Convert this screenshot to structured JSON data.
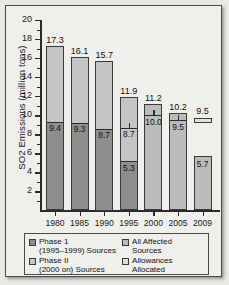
{
  "chart_data": {
    "type": "bar",
    "title": "",
    "xlabel": "",
    "ylabel": "SO2 Emissions (million tons)",
    "ylim": [
      0,
      20
    ],
    "ytick_step": 2,
    "grid": false,
    "legend_position": "below-axis",
    "categories": [
      "1980",
      "1985",
      "1990",
      "1995",
      "2000",
      "2005",
      "2009"
    ],
    "ytick_labels": [
      "20",
      "18",
      "16",
      "14",
      "12",
      "10",
      "8",
      "6",
      "4",
      "2"
    ],
    "series": [
      {
        "name": "Phase 1 (1995–1999) Sources",
        "values": [
          9.4,
          9.3,
          8.7,
          5.3,
          null,
          null,
          null
        ]
      },
      {
        "name": "Phase II (2000 on) Sources",
        "values": [
          7.9,
          6.8,
          7.0,
          3.4,
          null,
          null,
          null
        ]
      },
      {
        "name": "All Affected Sources",
        "values": [
          null,
          null,
          null,
          null,
          11.2,
          10.2,
          5.7
        ]
      },
      {
        "name": "Allowances Allocated",
        "values": [
          null,
          null,
          null,
          8.7,
          10.0,
          9.5,
          9.5
        ]
      }
    ],
    "bar_totals": [
      17.3,
      16.1,
      15.7,
      11.9,
      11.2,
      10.2,
      5.7
    ],
    "bars": [
      {
        "year": "1980",
        "total": 17.3,
        "total_label": "17.3",
        "phase1": 9.4,
        "phase1_label": "9.4",
        "allowance": null,
        "allowance_label": null
      },
      {
        "year": "1985",
        "total": 16.1,
        "total_label": "16.1",
        "phase1": 9.3,
        "phase1_label": "9.3",
        "allowance": null,
        "allowance_label": null
      },
      {
        "year": "1990",
        "total": 15.7,
        "total_label": "15.7",
        "phase1": 8.7,
        "phase1_label": "8.7",
        "allowance": null,
        "allowance_label": null
      },
      {
        "year": "1995",
        "total": 11.9,
        "total_label": "11.9",
        "phase1": 5.3,
        "phase1_label": "5.3",
        "allowance": 8.7,
        "allowance_label": "8.7"
      },
      {
        "year": "2000",
        "total": 11.2,
        "total_label": "11.2",
        "phase1": null,
        "phase1_label": null,
        "allowance": 10.0,
        "allowance_label": "10.0"
      },
      {
        "year": "2005",
        "total": 10.2,
        "total_label": "10.2",
        "phase1": null,
        "phase1_label": null,
        "allowance": 9.5,
        "allowance_label": "9.5"
      },
      {
        "year": "2009",
        "total": 5.7,
        "total_label": "5.7",
        "phase1": null,
        "phase1_label": null,
        "allowance": 9.5,
        "allowance_label": "9.5"
      }
    ],
    "colors": {
      "phase1": "#8e8e8e",
      "phase2": "#c5c5c5",
      "all_affected": "#bcbcbc",
      "allowances": "#e2e2de",
      "axis": "#2b2b2b",
      "background": "#efefeb"
    }
  },
  "legend": {
    "items": [
      {
        "swatch": "dark",
        "line1": "Phase 1",
        "line2": "(1995–1999) Sources"
      },
      {
        "swatch": "mid",
        "line1": "All Affected",
        "line2": "Sources"
      },
      {
        "swatch": "light",
        "line1": "Phase II",
        "line2": "(2000 on) Sources"
      },
      {
        "swatch": "pale",
        "line1": "Allowances",
        "line2": "Allocated"
      }
    ]
  }
}
